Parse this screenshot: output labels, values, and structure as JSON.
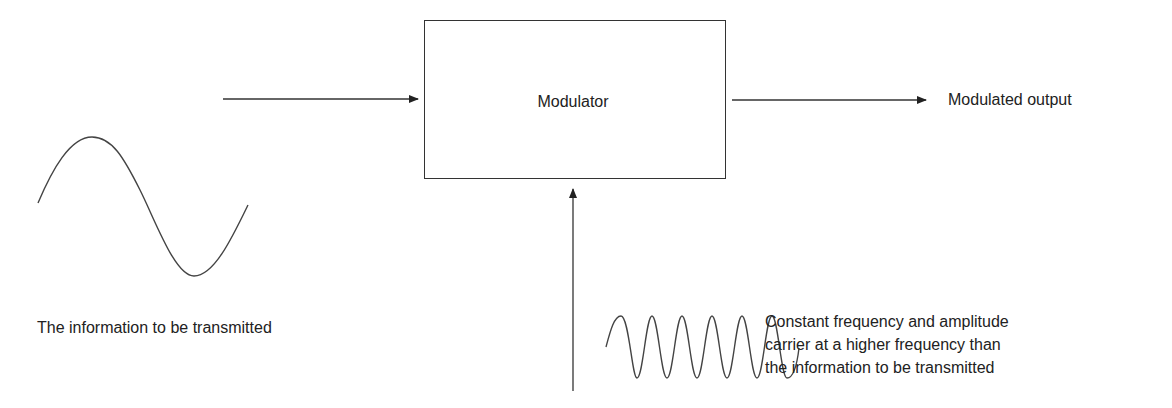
{
  "diagram": {
    "type": "block-diagram",
    "modulator_block": {
      "label": "Modulator"
    },
    "output": {
      "label": "Modulated output"
    },
    "information_signal": {
      "label": "The information to be transmitted",
      "waveform": "low-frequency sine, ~1 cycle"
    },
    "carrier_signal": {
      "label_lines": [
        "Constant frequency and amplitude",
        "carrier at a higher frequency than",
        "the information to be transmitted"
      ],
      "waveform": "high-frequency sine, ~6 cycles"
    },
    "connections": [
      {
        "from": "information_signal",
        "to": "modulator_block",
        "direction": "right"
      },
      {
        "from": "carrier_signal",
        "to": "modulator_block",
        "direction": "up"
      },
      {
        "from": "modulator_block",
        "to": "output",
        "direction": "right"
      }
    ],
    "colors": {
      "line": "#333333",
      "text": "#222222",
      "background": "#ffffff"
    }
  }
}
